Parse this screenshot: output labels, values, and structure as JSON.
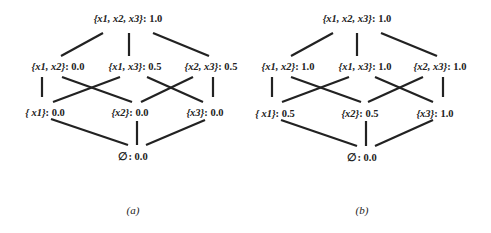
{
  "panels": [
    {
      "caption": "(a)",
      "nodes": {
        "x123": {
          "set": "{x1, x2, x3}",
          "value": "1.0"
        },
        "x12": {
          "set": "{x1, x2}",
          "value": "0.0"
        },
        "x13": {
          "set": "{x1, x3}",
          "value": "0.5"
        },
        "x23": {
          "set": "{x2, x3}",
          "value": "0.5"
        },
        "x1": {
          "set": "{ x1}",
          "value": "0.0"
        },
        "x2": {
          "set": "{x2}",
          "value": "0.0"
        },
        "x3": {
          "set": "{x3}",
          "value": "0.0"
        },
        "empty": {
          "set": "∅",
          "value": "0.0"
        }
      }
    },
    {
      "caption": "(b)",
      "nodes": {
        "x123": {
          "set": "{x1, x2, x3}",
          "value": "1.0"
        },
        "x12": {
          "set": "{x1, x2}",
          "value": "1.0"
        },
        "x13": {
          "set": "{x1, x3}",
          "value": "1.0"
        },
        "x23": {
          "set": "{x2, x3}",
          "value": "1.0"
        },
        "x1": {
          "set": "{ x1}",
          "value": "0.5"
        },
        "x2": {
          "set": "{x2}",
          "value": "0.5"
        },
        "x3": {
          "set": "{x3}",
          "value": "1.0"
        },
        "empty": {
          "set": "∅",
          "value": "0.0"
        }
      }
    }
  ]
}
